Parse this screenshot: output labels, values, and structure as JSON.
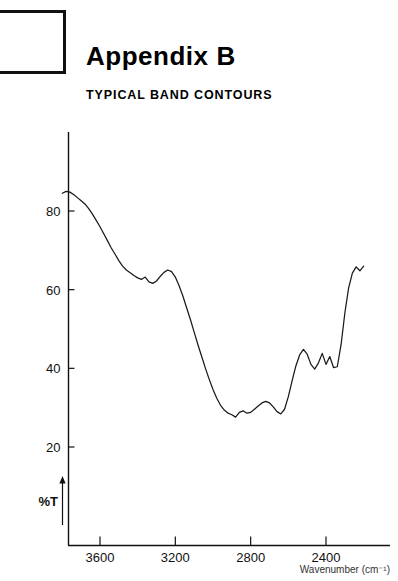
{
  "header": {
    "title_main": "Appendix",
    "title_letter": "B",
    "subtitle": "TYPICAL BAND CONTOURS"
  },
  "chart_data": {
    "type": "line",
    "title": "TYPICAL BAND CONTOURS",
    "xlabel": "Wavenumber (cm⁻¹)",
    "ylabel": "%T",
    "xlim": [
      3800,
      2180
    ],
    "ylim": [
      0,
      92
    ],
    "x_ticks": [
      3600,
      3200,
      2800,
      2400
    ],
    "x_tick_labels": [
      "3600",
      "3200",
      "2800",
      "2400"
    ],
    "y_ticks": [
      20,
      40,
      60,
      80
    ],
    "y_tick_labels": [
      "20",
      "40",
      "60",
      "80"
    ],
    "grid": false,
    "legend": null,
    "x_axis_direction": "decreasing",
    "series": [
      {
        "name": "Infrared transmittance spectrum",
        "color": "#1a1a1a",
        "x": [
          3800,
          3780,
          3760,
          3740,
          3720,
          3700,
          3680,
          3660,
          3640,
          3620,
          3600,
          3580,
          3560,
          3540,
          3520,
          3500,
          3480,
          3460,
          3440,
          3420,
          3400,
          3380,
          3360,
          3340,
          3320,
          3300,
          3280,
          3260,
          3240,
          3220,
          3200,
          3180,
          3160,
          3140,
          3120,
          3100,
          3080,
          3060,
          3040,
          3020,
          3000,
          2980,
          2960,
          2940,
          2920,
          2900,
          2880,
          2860,
          2840,
          2820,
          2800,
          2780,
          2760,
          2740,
          2720,
          2700,
          2680,
          2660,
          2640,
          2620,
          2600,
          2580,
          2560,
          2540,
          2520,
          2500,
          2480,
          2460,
          2440,
          2420,
          2400,
          2380,
          2360,
          2340,
          2320,
          2300,
          2280,
          2260,
          2240,
          2220,
          2200
        ],
        "y": [
          84.5,
          85.0,
          84.8,
          84.2,
          83.4,
          82.6,
          81.8,
          80.6,
          79.2,
          77.6,
          76.0,
          74.2,
          72.4,
          70.6,
          69.0,
          67.4,
          66.0,
          65.0,
          64.3,
          63.6,
          63.0,
          62.6,
          63.2,
          62.0,
          61.6,
          62.2,
          63.4,
          64.4,
          65.0,
          64.6,
          63.2,
          61.0,
          58.4,
          55.4,
          52.4,
          49.2,
          46.0,
          43.0,
          40.0,
          37.2,
          34.6,
          32.4,
          30.6,
          29.4,
          28.6,
          28.2,
          27.6,
          28.8,
          29.2,
          28.6,
          28.8,
          29.6,
          30.4,
          31.2,
          31.6,
          31.2,
          30.2,
          29.0,
          28.4,
          29.6,
          32.8,
          36.8,
          40.6,
          43.4,
          44.8,
          43.6,
          41.0,
          39.8,
          41.4,
          43.8,
          41.0,
          43.0,
          40.2,
          40.4,
          46.0,
          54.0,
          60.4,
          64.2,
          65.8,
          64.8,
          66.0
        ]
      }
    ],
    "annotations": [
      {
        "name": "y-axis-arrow",
        "text": "%T",
        "direction": "up"
      }
    ]
  }
}
